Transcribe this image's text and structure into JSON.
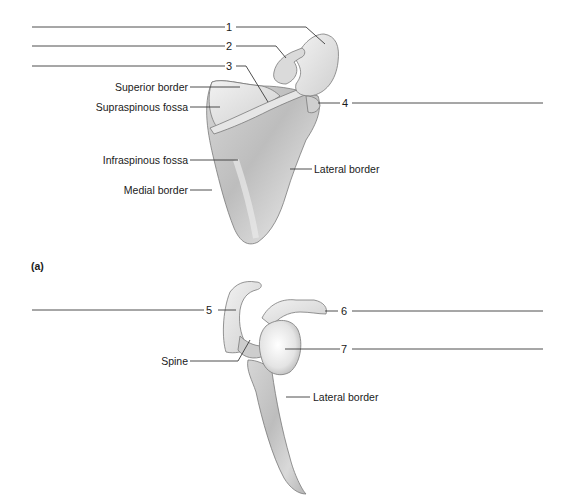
{
  "figure": {
    "panel_label": "(a)",
    "colors": {
      "bone_light": "#ededed",
      "bone_mid": "#c8c8c8",
      "bone_dark": "#8f8f8f",
      "outline": "#6e6e6e",
      "leader": "#3a3a3a"
    },
    "upper_view": {
      "numbered_labels": [
        "1",
        "2",
        "3",
        "4"
      ],
      "text_labels": {
        "superior_border": "Superior border",
        "supraspinous_fossa": "Supraspinous fossa",
        "infraspinous_fossa": "Infraspinous fossa",
        "medial_border": "Medial border",
        "lateral_border": "Lateral border"
      }
    },
    "lower_view": {
      "numbered_labels": [
        "5",
        "6",
        "7"
      ],
      "text_labels": {
        "spine": "Spine",
        "lateral_border": "Lateral border"
      }
    }
  }
}
